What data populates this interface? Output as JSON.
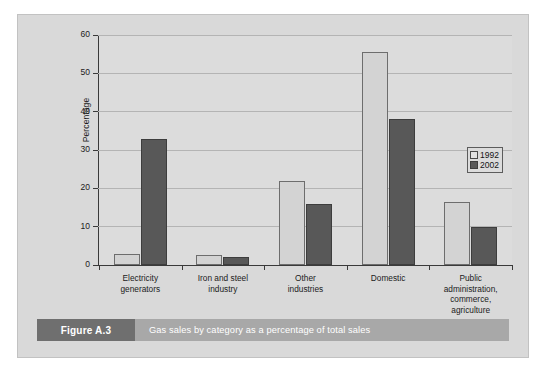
{
  "caption": {
    "tag": "Figure A.3",
    "text": "Gas sales by category as a percentage of total sales"
  },
  "legend": {
    "position": "right",
    "entries": [
      {
        "label": "1992",
        "color": "#e2e2e2"
      },
      {
        "label": "2002",
        "color": "#585858"
      }
    ]
  },
  "axis": {
    "y_title": "Percentage",
    "y_ticks": [
      "0",
      "10",
      "20",
      "30",
      "40",
      "50",
      "60"
    ]
  },
  "chart_data": {
    "type": "bar",
    "title": "Gas sales by category as a percentage of total sales",
    "xlabel": "",
    "ylabel": "Percentage",
    "ylim": [
      0,
      60
    ],
    "ytick_interval": 10,
    "grid": true,
    "legend_position": "right",
    "categories": [
      "Electricity generators",
      "Iron and steel industry",
      "Other industries",
      "Domestic",
      "Public administration, commerce, agriculture"
    ],
    "category_lines": [
      [
        "Electricity",
        "generators"
      ],
      [
        "Iron and steel",
        "industry"
      ],
      [
        "Other",
        "industries"
      ],
      [
        "Domestic"
      ],
      [
        "Public",
        "administration,",
        "commerce,",
        "agriculture"
      ]
    ],
    "series": [
      {
        "name": "1992",
        "color": "#d3d3d3",
        "values": [
          3,
          2.5,
          22,
          55.5,
          16.5
        ]
      },
      {
        "name": "2002",
        "color": "#585858",
        "values": [
          33,
          2,
          16,
          38,
          10
        ]
      }
    ]
  }
}
